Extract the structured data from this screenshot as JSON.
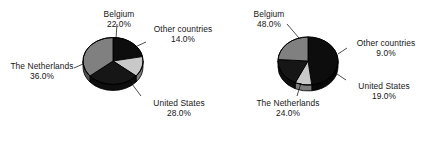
{
  "figure": {
    "background": "#ffffff",
    "panel_count": 2
  },
  "palette": {
    "black": "#0d0d0d",
    "dark_gray": "#262626",
    "mid_gray": "#808080",
    "light_gray": "#c8c8c8",
    "outline": "#000000",
    "text": "#161616"
  },
  "chart_data": [
    {
      "type": "pie",
      "title": "",
      "name": "left-pie",
      "categories": [
        "Belgium",
        "Other countries",
        "United States",
        "The Netherlands"
      ],
      "values": [
        22.0,
        14.0,
        28.0,
        36.0
      ],
      "labels": [
        "22.0%",
        "14.0%",
        "28.0%",
        "19.0%"
      ],
      "value_labels": [
        "22.0%",
        "14.0%",
        "28.0%",
        "36.0%"
      ],
      "colors": [
        "#0d0d0d",
        "#c8c8c8",
        "#161616",
        "#808080"
      ],
      "legend": "callout-labels",
      "start_angle_deg": -90,
      "direction": "clockwise",
      "slices": [
        {
          "label": "Belgium",
          "value": 22.0,
          "value_text": "22.0%",
          "color": "#0d0d0d"
        },
        {
          "label": "Other countries",
          "value": 14.0,
          "value_text": "14.0%",
          "color": "#c8c8c8"
        },
        {
          "label": "United States",
          "value": 28.0,
          "value_text": "28.0%",
          "color": "#161616"
        },
        {
          "label": "The Netherlands",
          "value": 36.0,
          "value_text": "36.0%",
          "color": "#808080"
        }
      ]
    },
    {
      "type": "pie",
      "title": "",
      "name": "right-pie",
      "categories": [
        "Belgium",
        "Other countries",
        "United States",
        "The Netherlands"
      ],
      "values": [
        48.0,
        9.0,
        19.0,
        24.0
      ],
      "value_labels": [
        "48.0%",
        "9.0%",
        "19.0%",
        "24.0%"
      ],
      "colors": [
        "#0d0d0d",
        "#c8c8c8",
        "#161616",
        "#808080"
      ],
      "legend": "callout-labels",
      "start_angle_deg": -90,
      "direction": "clockwise",
      "slices": [
        {
          "label": "Belgium",
          "value": 48.0,
          "value_text": "48.0%",
          "color": "#0d0d0d"
        },
        {
          "label": "Other countries",
          "value": 9.0,
          "value_text": "9.0%",
          "color": "#c8c8c8"
        },
        {
          "label": "United States",
          "value": 19.0,
          "value_text": "19.0%",
          "color": "#161616"
        },
        {
          "label": "The Netherlands",
          "value": 24.0,
          "value_text": "24.0%",
          "color": "#808080"
        }
      ]
    }
  ]
}
